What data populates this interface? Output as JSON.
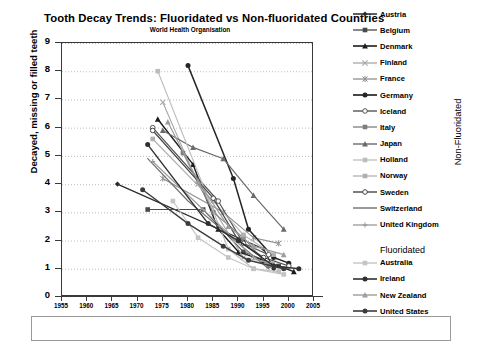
{
  "chart_data": {
    "type": "line",
    "title": "Tooth Decay Trends: Fluoridated  vs  Non-fluoridated Countries",
    "subtitle": "World Health Organisation",
    "xlabel": "",
    "ylabel": "Decayed, missing or filled teeth",
    "xlim": [
      1955,
      2005
    ],
    "ylim": [
      0,
      9
    ],
    "xticks": [
      1955,
      1960,
      1965,
      1970,
      1975,
      1980,
      1985,
      1990,
      1995,
      2000,
      2005
    ],
    "yticks": [
      0,
      1,
      2,
      3,
      4,
      5,
      6,
      7,
      8,
      9
    ],
    "grid": "horizontal-dotted",
    "legend_position": "right",
    "legend_groups": [
      {
        "label": "Non-Fluoridated",
        "orientation": "vertical-right"
      },
      {
        "label": "Fluoridated",
        "orientation": "horizontal-header"
      }
    ],
    "series": [
      {
        "name": "Austria",
        "group": "Non-Fluoridated",
        "marker": "diamond",
        "color": "#2b2b2b",
        "width": 1.3,
        "points": [
          [
            1966,
            4.0
          ],
          [
            1995,
            1.7
          ],
          [
            1997,
            1.0
          ]
        ]
      },
      {
        "name": "Belgium",
        "group": "Non-Fluoridated",
        "marker": "square",
        "color": "#4a4a4a",
        "width": 1.1,
        "points": [
          [
            1972,
            3.1
          ],
          [
            1983,
            3.1
          ],
          [
            1991,
            1.6
          ],
          [
            1998,
            1.1
          ]
        ]
      },
      {
        "name": "Denmark",
        "group": "Non-Fluoridated",
        "marker": "triangle",
        "color": "#1c1c1c",
        "width": 1.4,
        "points": [
          [
            1974,
            6.3
          ],
          [
            1981,
            4.7
          ],
          [
            1986,
            2.4
          ],
          [
            1990,
            1.6
          ],
          [
            1995,
            1.3
          ],
          [
            2001,
            0.9
          ]
        ]
      },
      {
        "name": "Finland",
        "group": "Non-Fluoridated",
        "marker": "cross-x",
        "color": "#a8a8a8",
        "width": 1.1,
        "points": [
          [
            1975,
            6.9
          ],
          [
            1982,
            4.0
          ],
          [
            1991,
            1.4
          ],
          [
            1997,
            1.2
          ]
        ]
      },
      {
        "name": "France",
        "group": "Non-Fluoridated",
        "marker": "asterisk",
        "color": "#8e8e8e",
        "width": 1.1,
        "points": [
          [
            1975,
            4.2
          ],
          [
            1987,
            3.0
          ],
          [
            1993,
            2.1
          ],
          [
            1998,
            1.9
          ]
        ]
      },
      {
        "name": "Germany",
        "group": "Non-Fluoridated",
        "marker": "circle",
        "color": "#262626",
        "width": 1.5,
        "points": [
          [
            1980,
            8.2
          ],
          [
            1989,
            4.2
          ],
          [
            1992,
            2.4
          ],
          [
            1997,
            1.4
          ],
          [
            2000,
            1.2
          ]
        ]
      },
      {
        "name": "Iceland",
        "group": "Non-Fluoridated",
        "marker": "circle-open",
        "color": "#555555",
        "width": 1.2,
        "points": [
          [
            1973,
            6.0
          ],
          [
            1986,
            3.4
          ],
          [
            1991,
            1.9
          ],
          [
            1996,
            1.5
          ]
        ]
      },
      {
        "name": "Italy",
        "group": "Non-Fluoridated",
        "marker": "square",
        "color": "#7d7d7d",
        "width": 1.1,
        "points": [
          [
            1979,
            5.1
          ],
          [
            1985,
            3.0
          ],
          [
            1991,
            2.1
          ],
          [
            1996,
            1.1
          ]
        ]
      },
      {
        "name": "Japan",
        "group": "Non-Fluoridated",
        "marker": "triangle",
        "color": "#6a6a6a",
        "width": 1.2,
        "points": [
          [
            1975,
            5.9
          ],
          [
            1981,
            5.3
          ],
          [
            1987,
            4.9
          ],
          [
            1993,
            3.6
          ],
          [
            1999,
            2.4
          ]
        ]
      },
      {
        "name": "Holland",
        "group": "Non-Fluoridated",
        "marker": "square-lt",
        "color": "#bdbdbd",
        "width": 1.1,
        "points": [
          [
            1974,
            8.0
          ],
          [
            1988,
            1.7
          ],
          [
            1993,
            1.0
          ],
          [
            1998,
            0.9
          ]
        ]
      },
      {
        "name": "Norway",
        "group": "Non-Fluoridated",
        "marker": "square-lt",
        "color": "#b0b0b0",
        "width": 1.1,
        "points": [
          [
            1973,
            5.6
          ],
          [
            1985,
            3.4
          ],
          [
            1991,
            2.2
          ],
          [
            1997,
            1.5
          ]
        ]
      },
      {
        "name": "Sweden",
        "group": "Non-Fluoridated",
        "marker": "circle-open",
        "color": "#454545",
        "width": 1.2,
        "points": [
          [
            1973,
            5.9
          ],
          [
            1985,
            3.5
          ],
          [
            1990,
            2.0
          ],
          [
            1995,
            1.4
          ],
          [
            2000,
            1.1
          ]
        ]
      },
      {
        "name": "Switzerland",
        "group": "Non-Fluoridated",
        "marker": "line",
        "color": "#707070",
        "width": 1.2,
        "points": [
          [
            1972,
            4.9
          ],
          [
            1980,
            3.4
          ],
          [
            1988,
            2.2
          ],
          [
            1996,
            1.0
          ]
        ]
      },
      {
        "name": "United Kingdom",
        "group": "Non-Fluoridated",
        "marker": "plus",
        "color": "#9a9a9a",
        "width": 1.1,
        "points": [
          [
            1973,
            4.8
          ],
          [
            1983,
            3.1
          ],
          [
            1993,
            1.4
          ],
          [
            1997,
            1.1
          ]
        ]
      },
      {
        "name": "Australia",
        "group": "Fluoridated",
        "marker": "square-lt",
        "color": "#c4c4c4",
        "width": 1.2,
        "points": [
          [
            1977,
            3.4
          ],
          [
            1982,
            2.1
          ],
          [
            1988,
            1.4
          ],
          [
            1993,
            1.0
          ],
          [
            1999,
            0.8
          ]
        ]
      },
      {
        "name": "Ireland",
        "group": "Fluoridated",
        "marker": "circle",
        "color": "#303030",
        "width": 1.4,
        "points": [
          [
            1972,
            5.4
          ],
          [
            1984,
            2.6
          ],
          [
            1990,
            2.0
          ],
          [
            1997,
            1.1
          ],
          [
            2002,
            1.0
          ]
        ]
      },
      {
        "name": "New Zealand",
        "group": "Fluoridated",
        "marker": "triangle",
        "color": "#9d9d9d",
        "width": 1.2,
        "points": [
          [
            1976,
            6.2
          ],
          [
            1982,
            4.1
          ],
          [
            1988,
            2.5
          ],
          [
            1993,
            1.8
          ],
          [
            1999,
            1.5
          ]
        ]
      },
      {
        "name": "United States",
        "group": "Fluoridated",
        "marker": "circle",
        "color": "#3c3c3c",
        "width": 1.4,
        "points": [
          [
            1971,
            3.8
          ],
          [
            1980,
            2.6
          ],
          [
            1987,
            1.8
          ],
          [
            1992,
            1.3
          ],
          [
            1999,
            1.0
          ]
        ]
      }
    ]
  },
  "axes": {
    "y_title": "Decayed, missing or filled teeth",
    "y_ticks": [
      "9",
      "8",
      "7",
      "6",
      "5",
      "4",
      "3",
      "2",
      "1",
      "0"
    ],
    "x_ticks": [
      "1955",
      "1960",
      "1965",
      "1970",
      "1975",
      "1980",
      "1985",
      "1990",
      "1995",
      "2000",
      "2005"
    ]
  },
  "legend": {
    "group_right_label": "Non-Fluoridated",
    "fluoridated_header": "Fluoridated",
    "non_fluoridated_items": [
      {
        "label": "Austria"
      },
      {
        "label": "Belgium"
      },
      {
        "label": "Denmark"
      },
      {
        "label": "Finland"
      },
      {
        "label": "France"
      },
      {
        "label": "Germany"
      },
      {
        "label": "Iceland"
      },
      {
        "label": "Italy"
      },
      {
        "label": "Japan"
      },
      {
        "label": "Holland"
      },
      {
        "label": "Norway"
      },
      {
        "label": "Sweden"
      },
      {
        "label": "Switzerland"
      },
      {
        "label": "United Kingdom"
      }
    ],
    "fluoridated_items": [
      {
        "label": "Australia"
      },
      {
        "label": "Ireland"
      },
      {
        "label": "New Zealand"
      },
      {
        "label": "United States"
      }
    ]
  },
  "colors": {
    "axis": "#3a3a3a",
    "grid": "#b5b5b5",
    "text": "#000000",
    "box_border": "#9a9a9a"
  }
}
